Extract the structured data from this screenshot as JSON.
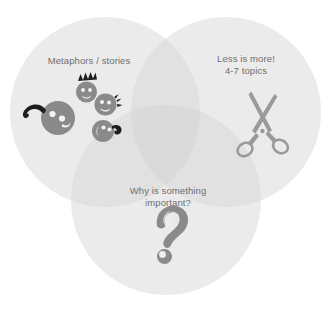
{
  "diagram": {
    "type": "venn-diagram",
    "circle_count": 3,
    "background_color": "#ffffff",
    "circle_fill": "#ebebeb",
    "overlap_fill": "#e0e0e0",
    "text_color": "#6e6e6e",
    "artwork_color": "#8a8a8a",
    "scissors_color": "#999999",
    "circles": [
      {
        "id": "circle-left",
        "label": "Metaphors / stories",
        "icon": "smiley-faces-cluster-icon",
        "cx": 105,
        "cy": 112,
        "r": 95
      },
      {
        "id": "circle-right",
        "label": "Less is more!\n4-7 topics",
        "icon": "scissors-icon",
        "cx": 226,
        "cy": 112,
        "r": 95
      },
      {
        "id": "circle-bottom",
        "label": "Why is something\nimportant?",
        "icon": "question-mark-icon",
        "cx": 166,
        "cy": 200,
        "r": 95
      }
    ]
  }
}
